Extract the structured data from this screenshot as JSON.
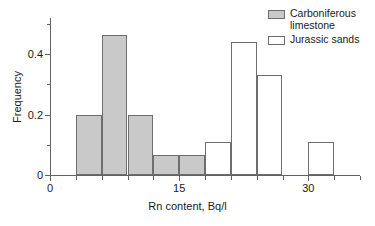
{
  "chart_data": {
    "type": "bar",
    "title": "",
    "subtitle": "",
    "xlabel": "Rn content, Bq/l",
    "ylabel": "Frequency",
    "xlim": [
      0,
      36
    ],
    "ylim": [
      0,
      0.52
    ],
    "grid": false,
    "legend_position": "top-right",
    "bin_width": 3,
    "x_ticks_major": [
      0,
      15,
      30
    ],
    "x_tick_labels": [
      "0",
      "15",
      "30"
    ],
    "x_ticks_minor": [
      3,
      6,
      9,
      12,
      18,
      21,
      24,
      27,
      33,
      36
    ],
    "y_ticks_major": [
      0,
      0.2,
      0.4
    ],
    "y_tick_labels": [
      "0",
      "0.2",
      "0.4"
    ],
    "y_ticks_minor": [
      0.1,
      0.3,
      0.5
    ],
    "series": [
      {
        "name": "Carboniferous limestone",
        "color": "#c9c9c9",
        "edge_color": "#6e6e6e",
        "bins": [
          {
            "x0": 3,
            "x1": 6,
            "value": 0.2
          },
          {
            "x0": 6,
            "x1": 9,
            "value": 0.465
          },
          {
            "x0": 9,
            "x1": 12,
            "value": 0.2
          },
          {
            "x0": 12,
            "x1": 15,
            "value": 0.065
          },
          {
            "x0": 15,
            "x1": 18,
            "value": 0.065
          }
        ]
      },
      {
        "name": "Jurassic sands",
        "color": "#ffffff",
        "edge_color": "#6e6e6e",
        "bins": [
          {
            "x0": 18,
            "x1": 21,
            "value": 0.11
          },
          {
            "x0": 21,
            "x1": 24,
            "value": 0.44
          },
          {
            "x0": 24,
            "x1": 27,
            "value": 0.33
          },
          {
            "x0": 30,
            "x1": 33,
            "value": 0.11
          }
        ]
      }
    ]
  },
  "legend": {
    "items": [
      {
        "label": "Carboniferous\nlimestone",
        "swatch": "carboniferous"
      },
      {
        "label": "Jurassic sands",
        "swatch": "jurassic"
      }
    ]
  },
  "axes": {
    "x_title": "Rn content, Bq/l",
    "y_title": "Frequency"
  }
}
